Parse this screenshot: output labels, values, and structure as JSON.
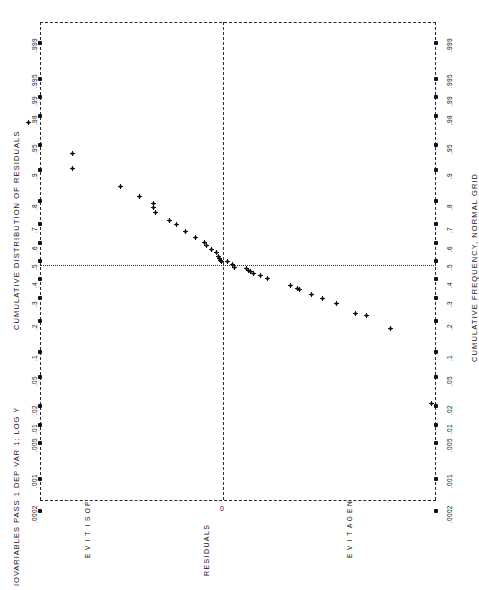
{
  "figure": {
    "header_title": "IOVARIABLES PASS 1  DEP VAR 1: LOG Y",
    "left_axis_title": "CUMULATIVE DISTRIBUTION OF RESIDUALS",
    "right_axis_title": "CUMULATIVE FREQUENCY, NORMAL GRID",
    "bottom_axis_title": "RESIDUALS",
    "center_label": "0",
    "positive_label": "POSITIVE",
    "negative_label": "NEGATIVE",
    "ink_color": "#111111",
    "background_color": "#ffffff"
  },
  "chart_data": {
    "type": "scatter",
    "title": "IOVARIABLES PASS 1  DEP VAR 1: LOG Y",
    "subtitle": "CUMULATIVE DISTRIBUTION OF RESIDUALS",
    "xlabel": "RESIDUALS",
    "ylabel": "CUMULATIVE FREQUENCY, NORMAL GRID",
    "orientation": "rotated-90",
    "grid": "dashed-border-with-median-crosshair",
    "legend": "none",
    "probability_ticks": [
      ".0002",
      ".001",
      ".005",
      ".01",
      ".02",
      ".05",
      ".1",
      ".2",
      ".3",
      ".4",
      ".5",
      ".6",
      ".7",
      ".8",
      ".9",
      ".95",
      ".98",
      ".99",
      ".995",
      ".999"
    ],
    "probability_tick_values": [
      0.0002,
      0.001,
      0.005,
      0.01,
      0.02,
      0.05,
      0.1,
      0.2,
      0.3,
      0.4,
      0.5,
      0.6,
      0.7,
      0.8,
      0.9,
      0.95,
      0.98,
      0.99,
      0.995,
      0.999
    ],
    "annotations": [
      "POSITIVE",
      "0",
      "NEGATIVE"
    ],
    "median_line_probability": 0.5,
    "zero_residual_line": 0.0,
    "note": "Normal probability plot of residuals; point list given as cumulative-probability p and residual r (residual axis is the short axis, positive to the left of 0).",
    "points": [
      {
        "p": 0.975,
        "r": 0.84
      },
      {
        "p": 0.935,
        "r": 0.65
      },
      {
        "p": 0.905,
        "r": 0.65
      },
      {
        "p": 0.855,
        "r": 0.44
      },
      {
        "p": 0.818,
        "r": 0.36
      },
      {
        "p": 0.79,
        "r": 0.3
      },
      {
        "p": 0.775,
        "r": 0.3
      },
      {
        "p": 0.752,
        "r": 0.29
      },
      {
        "p": 0.718,
        "r": 0.23
      },
      {
        "p": 0.698,
        "r": 0.2
      },
      {
        "p": 0.663,
        "r": 0.16
      },
      {
        "p": 0.632,
        "r": 0.12
      },
      {
        "p": 0.603,
        "r": 0.08
      },
      {
        "p": 0.588,
        "r": 0.07
      },
      {
        "p": 0.565,
        "r": 0.05
      },
      {
        "p": 0.548,
        "r": 0.03
      },
      {
        "p": 0.525,
        "r": 0.02
      },
      {
        "p": 0.515,
        "r": 0.015
      },
      {
        "p": 0.505,
        "r": 0.01
      },
      {
        "p": 0.5,
        "r": 0.005
      },
      {
        "p": 0.495,
        "r": -0.02
      },
      {
        "p": 0.478,
        "r": -0.04
      },
      {
        "p": 0.462,
        "r": -0.05
      },
      {
        "p": 0.455,
        "r": -0.1
      },
      {
        "p": 0.448,
        "r": -0.11
      },
      {
        "p": 0.44,
        "r": -0.12
      },
      {
        "p": 0.432,
        "r": -0.13
      },
      {
        "p": 0.418,
        "r": -0.16
      },
      {
        "p": 0.4,
        "r": -0.19
      },
      {
        "p": 0.362,
        "r": -0.29
      },
      {
        "p": 0.348,
        "r": -0.32
      },
      {
        "p": 0.342,
        "r": -0.33
      },
      {
        "p": 0.32,
        "r": -0.38
      },
      {
        "p": 0.296,
        "r": -0.43
      },
      {
        "p": 0.272,
        "r": -0.49
      },
      {
        "p": 0.228,
        "r": -0.57
      },
      {
        "p": 0.222,
        "r": -0.62
      },
      {
        "p": 0.17,
        "r": -0.72
      },
      {
        "p": 0.022,
        "r": -0.9
      }
    ]
  }
}
